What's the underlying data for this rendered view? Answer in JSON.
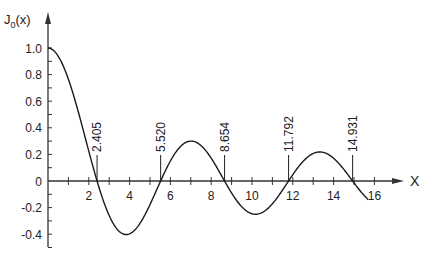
{
  "chart_data": {
    "type": "line",
    "title": "",
    "xlabel": "X",
    "ylabel": "J0(x)",
    "ylabel_main": "J",
    "ylabel_sub": "0",
    "ylabel_arg": "(x)",
    "xlim": [
      0,
      17
    ],
    "ylim": [
      -0.5,
      1.2
    ],
    "grid": false,
    "legend": null,
    "x_ticks": [
      1,
      2,
      3,
      4,
      5,
      6,
      7,
      8,
      9,
      10,
      11,
      12,
      13,
      14,
      15,
      16
    ],
    "x_tick_labels": [
      "2",
      "4",
      "6",
      "8",
      "10",
      "12",
      "14",
      "16"
    ],
    "x_tick_label_values": [
      2,
      4,
      6,
      8,
      10,
      12,
      14,
      16
    ],
    "y_ticks": [
      -0.5,
      -0.4,
      -0.3,
      -0.2,
      -0.1,
      0.1,
      0.2,
      0.3,
      0.4,
      0.5,
      0.6,
      0.7,
      0.8,
      0.9,
      1.0
    ],
    "y_tick_labels": [
      "1.0",
      "0.8",
      "0.6",
      "0.4",
      "0.2",
      "0",
      "-0.2",
      "-0.4"
    ],
    "y_tick_label_values": [
      1.0,
      0.8,
      0.6,
      0.4,
      0.2,
      0,
      -0.2,
      -0.4
    ],
    "annotations": [
      {
        "x": 2.405,
        "label": "2.405"
      },
      {
        "x": 5.52,
        "label": "5.520"
      },
      {
        "x": 8.654,
        "label": "8.654"
      },
      {
        "x": 11.792,
        "label": "11.792"
      },
      {
        "x": 14.931,
        "label": "14.931"
      }
    ],
    "series": [
      {
        "name": "J0(x)",
        "x": [
          0,
          1,
          2,
          2.405,
          3,
          3.832,
          4,
          5,
          5.52,
          6,
          7,
          7.016,
          8,
          8.654,
          9,
          10,
          10.173,
          11,
          11.792,
          12,
          13,
          13.324,
          14,
          14.931,
          15,
          15.7
        ],
        "y": [
          1.0,
          0.765,
          0.224,
          0.0,
          -0.26,
          -0.403,
          -0.397,
          -0.178,
          0.0,
          0.151,
          0.3,
          0.3,
          0.172,
          0.0,
          -0.09,
          -0.246,
          -0.25,
          -0.171,
          0.0,
          0.048,
          0.207,
          0.218,
          0.171,
          0.0,
          -0.014,
          -0.19
        ]
      }
    ],
    "curve_domain": [
      0,
      15.7
    ]
  }
}
